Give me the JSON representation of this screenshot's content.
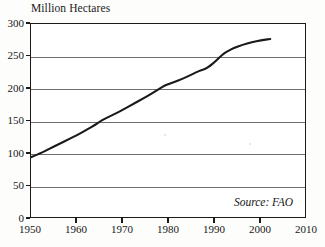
{
  "chart_data": {
    "type": "line",
    "title": "Million Hectares",
    "xlabel": "",
    "ylabel": "Million Hectares",
    "xlim": [
      1950,
      2010
    ],
    "ylim": [
      0,
      300
    ],
    "grid": true,
    "legend": null,
    "source_note": "Source: FAO",
    "xticks": [
      1950,
      1960,
      1970,
      1980,
      1990,
      2000,
      2010
    ],
    "yticks": [
      0,
      50,
      100,
      150,
      200,
      250,
      300
    ],
    "series": [
      {
        "name": "Irrigated Area",
        "x": [
          1950,
          1952,
          1954,
          1956,
          1958,
          1960,
          1962,
          1964,
          1965,
          1966,
          1968,
          1970,
          1972,
          1974,
          1976,
          1978,
          1979,
          1980,
          1982,
          1984,
          1986,
          1987,
          1988,
          1989,
          1990,
          1991,
          1992,
          1993,
          1994,
          1996,
          1998,
          2000,
          2002
        ],
        "values": [
          95,
          101,
          108,
          115,
          122,
          129,
          137,
          145,
          150,
          154,
          161,
          168,
          176,
          184,
          192,
          201,
          205,
          208,
          213,
          219,
          226,
          229,
          231,
          236,
          242,
          249,
          255,
          259,
          263,
          268,
          272,
          275,
          277
        ]
      }
    ]
  },
  "axis": {
    "title": "Million Hectares",
    "y_labels": [
      "300",
      "250",
      "200",
      "150",
      "100",
      "50",
      "0"
    ],
    "x_labels": [
      "1950",
      "1960",
      "1970",
      "1980",
      "1990",
      "2000",
      "2010"
    ]
  },
  "footer": {
    "source": "Source: FAO"
  },
  "colors": {
    "line": "#1a1a1a",
    "grid": "#6e6e6e",
    "axis": "#1a1a1a",
    "background": "#ffffff",
    "text": "#171717"
  }
}
